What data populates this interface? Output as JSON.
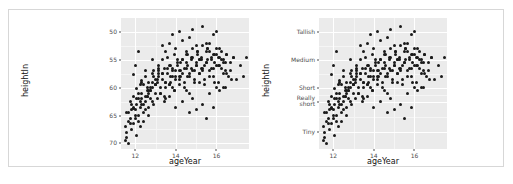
{
  "figure": {
    "caption": "",
    "panels": [
      {
        "id": "left",
        "y_axis_type": "continuous",
        "xlabel": "ageYear",
        "ylabel": "heightIn",
        "xticks": [
          "12",
          "14",
          "16"
        ],
        "yticks": [
          "70",
          "65",
          "60",
          "55",
          "50"
        ]
      },
      {
        "id": "right",
        "y_axis_type": "categorical",
        "xlabel": "ageYear",
        "ylabel": "heightIn",
        "xticks": [
          "12",
          "14",
          "16"
        ],
        "yticks": [
          "Tallish",
          "Medium",
          "Short",
          "Really\nshort",
          "Tiny"
        ]
      }
    ]
  },
  "chart_data": {
    "type": "scatter",
    "title": "",
    "panel_layout": "two panels side by side, same data, different y-axis scale labels",
    "xlabel": "ageYear",
    "ylabel": "heightIn",
    "xlim": [
      11.3,
      17.6
    ],
    "ylim": [
      49.0,
      72.5
    ],
    "grid": true,
    "legend": null,
    "panels": [
      {
        "name": "left-panel-continuous-y",
        "y_scale": "continuous",
        "xticks": [
          12,
          14,
          16
        ],
        "yticks": [
          50,
          55,
          60,
          65,
          70
        ]
      },
      {
        "name": "right-panel-categorical-y",
        "y_scale": "discrete-labels",
        "xticks": [
          12,
          14,
          16
        ],
        "ytick_values": [
          70,
          65,
          60,
          57.5,
          52
        ],
        "ytick_labels": [
          "Tallish",
          "Medium",
          "Short",
          "Really short",
          "Tiny"
        ]
      }
    ],
    "x": [
      11.92,
      11.92,
      12.08,
      12.17,
      12.25,
      12.33,
      12.42,
      12.5,
      12.58,
      12.67,
      12.75,
      12.83,
      12.92,
      13.0,
      13.08,
      13.17,
      13.25,
      13.33,
      13.42,
      13.5,
      13.58,
      13.67,
      13.75,
      13.83,
      13.92,
      14.0,
      14.08,
      14.17,
      14.25,
      14.33,
      14.42,
      14.5,
      14.58,
      14.67,
      14.75,
      14.83,
      14.92,
      15.0,
      15.08,
      15.17,
      15.25,
      15.33,
      15.42,
      15.5,
      15.58,
      15.67,
      15.75,
      15.83,
      15.92,
      16.0,
      16.08,
      16.17,
      16.25,
      16.33,
      16.42,
      16.5,
      16.58,
      16.67,
      16.75,
      16.83,
      11.58,
      11.67,
      11.75,
      11.83,
      11.92,
      12.0,
      12.08,
      12.17,
      12.25,
      12.33,
      12.42,
      12.5,
      12.58,
      12.67,
      12.75,
      12.83,
      12.92,
      13.0,
      13.08,
      13.17,
      13.25,
      13.33,
      13.42,
      13.5,
      13.58,
      13.67,
      13.75,
      13.83,
      13.92,
      14.0,
      14.08,
      14.17,
      14.25,
      14.33,
      14.42,
      14.5,
      14.58,
      14.67,
      14.75,
      14.83,
      14.92,
      15.0,
      15.08,
      15.17,
      15.25,
      15.33,
      15.42,
      15.5,
      15.58,
      15.67,
      15.75,
      15.83,
      15.92,
      16.0,
      16.08,
      16.17,
      16.25,
      16.33,
      16.42,
      16.5,
      11.5,
      11.58,
      11.67,
      11.75,
      11.83,
      11.92,
      12.0,
      12.08,
      12.17,
      12.25,
      12.33,
      12.42,
      12.5,
      12.58,
      12.67,
      12.75,
      12.83,
      12.92,
      13.0,
      13.08,
      13.17,
      13.25,
      13.33,
      13.42,
      13.5,
      13.58,
      13.67,
      13.75,
      13.83,
      13.92,
      14.0,
      14.08,
      14.17,
      14.25,
      14.33,
      14.42,
      14.5,
      14.58,
      14.67,
      14.75,
      14.83,
      14.92,
      15.0,
      15.08,
      15.17,
      15.25,
      15.33,
      15.42,
      15.5,
      15.58,
      15.67,
      15.75,
      15.83,
      15.92,
      16.0,
      16.08,
      16.17,
      16.25,
      16.33,
      16.42,
      11.5,
      11.58,
      11.67,
      11.75,
      11.83,
      11.92,
      12.0,
      12.08,
      12.17,
      12.25,
      12.33,
      12.42,
      12.5,
      12.58,
      12.67,
      12.75,
      12.83,
      13.0,
      13.17,
      13.33,
      13.5,
      13.67,
      13.83,
      14.0,
      14.17,
      14.33,
      14.5,
      14.67,
      14.83,
      15.0,
      15.17,
      15.33,
      15.5,
      15.67,
      15.83,
      16.0,
      16.17,
      16.33,
      16.5,
      16.67,
      16.83,
      17.0,
      17.17,
      17.33,
      17.5,
      12.0,
      12.17,
      12.33,
      12.5,
      12.67,
      12.83,
      13.0,
      13.17,
      13.33,
      13.5,
      13.67,
      13.83,
      14.0,
      14.17,
      14.33,
      14.5,
      14.67,
      14.83,
      15.0,
      15.17,
      15.33,
      15.5,
      15.67,
      15.83,
      16.0
    ],
    "y": [
      56.3,
      62.3,
      59.8,
      58.0,
      60.5,
      61.3,
      57.0,
      62.0,
      58.5,
      59.5,
      60.0,
      62.5,
      63.0,
      60.5,
      61.0,
      64.0,
      59.0,
      62.5,
      63.5,
      61.0,
      65.5,
      60.5,
      62.0,
      63.0,
      66.0,
      61.5,
      64.5,
      63.0,
      62.0,
      65.0,
      63.5,
      66.5,
      64.0,
      62.5,
      65.5,
      67.0,
      63.0,
      64.5,
      66.0,
      65.0,
      63.5,
      67.5,
      64.0,
      66.5,
      65.0,
      68.0,
      63.5,
      66.0,
      64.5,
      67.0,
      65.5,
      64.0,
      66.5,
      65.0,
      63.0,
      66.0,
      62.0,
      64.5,
      61.5,
      65.5,
      55.5,
      54.0,
      57.5,
      56.0,
      58.5,
      55.0,
      57.0,
      59.0,
      56.5,
      58.0,
      60.5,
      57.5,
      59.5,
      61.0,
      58.0,
      60.0,
      62.0,
      59.0,
      61.5,
      63.0,
      60.0,
      62.5,
      58.5,
      61.0,
      63.5,
      60.5,
      64.0,
      62.0,
      59.5,
      63.0,
      65.0,
      61.5,
      64.5,
      62.5,
      60.0,
      63.5,
      66.0,
      62.0,
      65.0,
      63.0,
      61.0,
      64.0,
      66.5,
      62.5,
      65.5,
      63.5,
      61.5,
      64.5,
      67.0,
      63.0,
      65.0,
      62.0,
      66.0,
      64.0,
      61.0,
      65.5,
      63.5,
      60.0,
      64.5,
      62.5,
      53.0,
      52.0,
      55.5,
      54.5,
      57.0,
      53.5,
      56.0,
      58.0,
      54.0,
      57.5,
      59.0,
      55.5,
      58.5,
      60.0,
      56.5,
      59.5,
      61.0,
      57.0,
      60.5,
      58.0,
      62.0,
      59.0,
      61.5,
      57.5,
      60.0,
      62.5,
      58.5,
      61.0,
      63.5,
      59.5,
      62.0,
      64.0,
      60.5,
      63.0,
      65.0,
      61.0,
      64.5,
      62.0,
      59.0,
      63.5,
      65.5,
      61.5,
      64.0,
      66.5,
      62.5,
      65.0,
      63.0,
      60.5,
      64.5,
      67.0,
      62.0,
      65.5,
      63.5,
      61.0,
      66.0,
      64.0,
      59.5,
      65.0,
      62.5,
      60.0,
      50.5,
      51.0,
      50.0,
      53.5,
      52.5,
      56.5,
      54.5,
      51.5,
      55.0,
      53.0,
      57.0,
      54.0,
      56.0,
      58.5,
      55.0,
      59.5,
      57.5,
      61.5,
      63.5,
      65.0,
      66.5,
      68.0,
      69.5,
      67.0,
      70.0,
      68.5,
      66.0,
      69.0,
      70.5,
      67.5,
      65.0,
      71.0,
      68.0,
      66.5,
      69.5,
      70.0,
      67.0,
      64.5,
      66.0,
      63.0,
      65.5,
      61.5,
      64.0,
      62.0,
      65.5,
      64.0,
      66.5,
      61.0,
      63.0,
      59.0,
      65.0,
      60.5,
      62.5,
      67.5,
      58.0,
      64.0,
      60.0,
      56.5,
      62.0,
      57.5,
      59.5,
      55.5,
      58.0,
      56.0,
      61.0,
      57.0,
      54.5,
      59.0,
      56.5,
      60.0
    ]
  }
}
